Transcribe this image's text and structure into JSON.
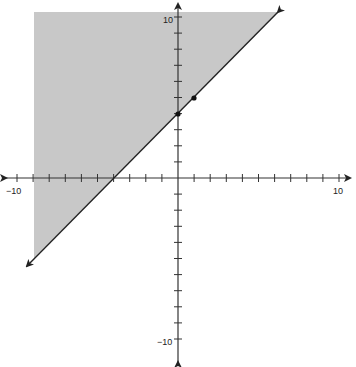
{
  "chart_data": {
    "type": "line",
    "title": "",
    "xlabel": "",
    "ylabel": "",
    "xlim": [
      -10,
      10
    ],
    "ylim": [
      -10,
      10
    ],
    "grid": false,
    "legend": null,
    "x_tick_labels": [
      "-10",
      "10"
    ],
    "y_tick_labels": [
      "10",
      "-10"
    ],
    "tick_interval": 1,
    "series": [
      {
        "name": "boundary line",
        "equation": "y = x + 4",
        "slope": 1,
        "intercept": 4,
        "style": "solid",
        "arrows": "both",
        "x": [
          -9.4,
          6.3
        ],
        "y": [
          -5.4,
          10.3
        ]
      }
    ],
    "points": [
      {
        "x": 0,
        "y": 4
      },
      {
        "x": 1,
        "y": 5
      }
    ],
    "shaded_region": {
      "description": "Region above/left of the line y = x + 4",
      "inequality": "y >= x + 4",
      "color": "#c8c8c8"
    }
  },
  "labels": {
    "x_min": "−10",
    "x_max": "10",
    "y_max": "10",
    "y_min": "−10"
  },
  "colors": {
    "shade": "#c8c8c8",
    "line": "#222222",
    "axis": "#333333"
  }
}
